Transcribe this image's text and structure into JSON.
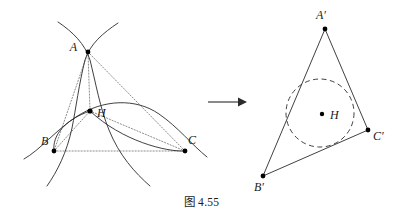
{
  "figure": {
    "caption_prefix": "图",
    "caption_number": "4.55",
    "stroke_color": "#2b2b2b",
    "dotted_color": "#8a8a8a",
    "point_color": "#000000",
    "left_diagram": {
      "name": "three-arcs-through-orthocenter",
      "points": [
        {
          "id": "A",
          "label": "A",
          "x": 88,
          "y": 52,
          "label_dx": -11,
          "label_dy": -1
        },
        {
          "id": "B",
          "label": "B",
          "x": 54,
          "y": 151,
          "label_dx": -13,
          "label_dy": -6
        },
        {
          "id": "C",
          "label": "C",
          "x": 185,
          "y": 151,
          "label_dx": 3,
          "label_dy": -7
        },
        {
          "id": "H",
          "label": "H",
          "x": 90,
          "y": 111,
          "label_dx": 6,
          "label_dy": 6
        }
      ],
      "arcs": [
        {
          "name": "arc-through-A-B-H",
          "d": "M 118 23 C 101 34 88 45 83 62 C 76 88 72 118 65 140 C 58 163 51 175 46 184"
        },
        {
          "name": "arc-through-A-C-H",
          "d": "M 58 22 C 74 33 85 45 90 62 C 97 90 104 121 117 142 C 128 160 139 172 150 182"
        },
        {
          "name": "arc-through-B-C-H",
          "d": "M 26 158 C 44 147 62 124 90 111 C 128 93 160 106 180 130 C 192 144 200 152 207 158"
        },
        {
          "name": "arc-lens-B-H",
          "d": "M 54 151 C 54 138 70 120 90 111"
        },
        {
          "name": "arc-lens-C-H",
          "d": "M 185 151 C 170 151 125 140 90 111"
        }
      ],
      "dotted_segments": [
        {
          "name": "segment-A-B",
          "x1": 88,
          "y1": 52,
          "x2": 54,
          "y2": 151
        },
        {
          "name": "segment-A-C",
          "x1": 88,
          "y1": 52,
          "x2": 185,
          "y2": 151
        },
        {
          "name": "segment-B-C",
          "x1": 54,
          "y1": 151,
          "x2": 185,
          "y2": 151
        },
        {
          "name": "cevian-A-H",
          "x1": 88,
          "y1": 52,
          "x2": 90,
          "y2": 111
        },
        {
          "name": "cevian-B-H",
          "x1": 54,
          "y1": 151,
          "x2": 90,
          "y2": 111
        },
        {
          "name": "cevian-C-H",
          "x1": 185,
          "y1": 151,
          "x2": 90,
          "y2": 111
        }
      ]
    },
    "arrow": {
      "name": "transformation-arrow",
      "x1": 208,
      "y1": 102,
      "x2": 243,
      "y2": 102
    },
    "right_diagram": {
      "name": "triangle-with-incircle",
      "points": [
        {
          "id": "A'",
          "label": "A′",
          "x": 325,
          "y": 29,
          "label_dx": -4,
          "label_dy": -8
        },
        {
          "id": "B'",
          "label": "B′",
          "x": 263,
          "y": 176,
          "label_dx": -4,
          "label_dy": 13
        },
        {
          "id": "C'",
          "label": "C′",
          "x": 368,
          "y": 130,
          "label_dx": 5,
          "label_dy": 9
        },
        {
          "id": "H",
          "label": "H",
          "x": 322,
          "y": 114,
          "label_dx": 7,
          "label_dy": 4
        }
      ],
      "sides": [
        {
          "name": "side-A-B",
          "x1": 325,
          "y1": 29,
          "x2": 263,
          "y2": 176
        },
        {
          "name": "side-A-C",
          "x1": 325,
          "y1": 29,
          "x2": 368,
          "y2": 130
        },
        {
          "name": "side-B-C",
          "x1": 263,
          "y1": 176,
          "x2": 368,
          "y2": 130
        }
      ],
      "incircle": {
        "name": "incircle",
        "cx": 320,
        "cy": 113,
        "r": 34,
        "style": "dashed"
      }
    }
  }
}
